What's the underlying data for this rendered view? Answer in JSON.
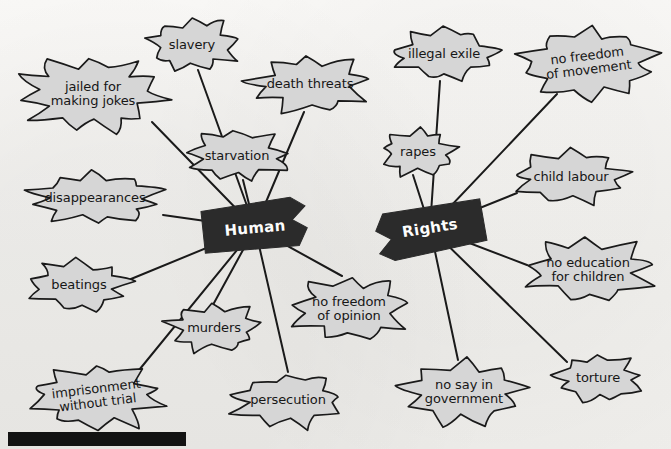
{
  "diagram": {
    "type": "mind-map",
    "title_words": [
      {
        "text": "Human",
        "x": 255,
        "y": 228,
        "rotate": -5
      },
      {
        "text": "Rights",
        "x": 430,
        "y": 228,
        "rotate": -9
      }
    ],
    "background_color": "#f6f5f3",
    "burst_fill": "#d6d6d6",
    "burst_stroke": "#1a1a1a",
    "banner_fill": "#2b2b2b",
    "banner_text_color": "#fdfdfd",
    "edge_color": "#1a1a1a"
  },
  "nodes": [
    {
      "id": "jailed-for-making-jokes",
      "label": "jailed for\nmaking jokes",
      "cx": 93,
      "cy": 94,
      "rx": 74,
      "ry": 38,
      "rotate": 0,
      "font": 13,
      "parent": "human",
      "anchor": [
        152,
        122
      ]
    },
    {
      "id": "slavery",
      "label": "slavery",
      "cx": 192,
      "cy": 45,
      "rx": 48,
      "ry": 28,
      "rotate": 0,
      "font": 13,
      "parent": "human",
      "anchor": [
        198,
        70
      ]
    },
    {
      "id": "death-threats",
      "label": "death threats",
      "cx": 310,
      "cy": 84,
      "rx": 62,
      "ry": 29,
      "rotate": 0,
      "font": 13,
      "parent": "human",
      "anchor": [
        304,
        112
      ]
    },
    {
      "id": "starvation",
      "label": "starvation",
      "cx": 237,
      "cy": 156,
      "rx": 53,
      "ry": 26,
      "rotate": 0,
      "font": 13,
      "parent": "human",
      "anchor": [
        243,
        180
      ]
    },
    {
      "id": "disappearances",
      "label": "disappearances",
      "cx": 95,
      "cy": 198,
      "rx": 70,
      "ry": 27,
      "rotate": 0,
      "font": 13,
      "parent": "human",
      "anchor": [
        163,
        215
      ]
    },
    {
      "id": "beatings",
      "label": "beatings",
      "cx": 79,
      "cy": 285,
      "rx": 53,
      "ry": 26,
      "rotate": 0,
      "font": 13,
      "parent": "human",
      "anchor": [
        131,
        279
      ]
    },
    {
      "id": "imprisonment-without-trial",
      "label": "imprisonment\nwithout trial",
      "cx": 97,
      "cy": 396,
      "rx": 70,
      "ry": 34,
      "rotate": -7,
      "font": 13,
      "parent": "human",
      "anchor": [
        135,
        375
      ]
    },
    {
      "id": "murders",
      "label": "murders",
      "cx": 214,
      "cy": 328,
      "rx": 48,
      "ry": 25,
      "rotate": 0,
      "font": 13,
      "parent": "human",
      "anchor": [
        214,
        303
      ]
    },
    {
      "id": "persecution",
      "label": "persecution",
      "cx": 288,
      "cy": 400,
      "rx": 58,
      "ry": 28,
      "rotate": 0,
      "font": 13,
      "parent": "human",
      "anchor": [
        288,
        372
      ]
    },
    {
      "id": "no-freedom-of-opinion",
      "label": "no freedom\nof opinion",
      "cx": 349,
      "cy": 309,
      "rx": 62,
      "ry": 33,
      "rotate": 0,
      "font": 13,
      "parent": "human",
      "anchor": [
        342,
        276
      ]
    },
    {
      "id": "illegal-exile",
      "label": "illegal exile",
      "cx": 444,
      "cy": 54,
      "rx": 56,
      "ry": 27,
      "rotate": 0,
      "font": 13,
      "parent": "rights",
      "anchor": [
        440,
        81
      ]
    },
    {
      "id": "no-freedom-of-movement",
      "label": "no freedom\nof movement",
      "cx": 588,
      "cy": 63,
      "rx": 72,
      "ry": 36,
      "rotate": -7,
      "font": 13,
      "parent": "rights",
      "anchor": [
        557,
        94
      ]
    },
    {
      "id": "rapes",
      "label": "rapes",
      "cx": 418,
      "cy": 152,
      "rx": 40,
      "ry": 24,
      "rotate": 0,
      "font": 13,
      "parent": "rights",
      "anchor": [
        413,
        175
      ]
    },
    {
      "id": "child-labour",
      "label": "child labour",
      "cx": 571,
      "cy": 177,
      "rx": 60,
      "ry": 28,
      "rotate": 0,
      "font": 13,
      "parent": "rights",
      "anchor": [
        517,
        193
      ]
    },
    {
      "id": "no-education-for-children",
      "label": "no education\nfor children",
      "cx": 588,
      "cy": 270,
      "rx": 66,
      "ry": 33,
      "rotate": 0,
      "font": 13,
      "parent": "rights",
      "anchor": [
        527,
        265
      ]
    },
    {
      "id": "no-say-in-government",
      "label": "no say in\ngovernment",
      "cx": 464,
      "cy": 392,
      "rx": 63,
      "ry": 33,
      "rotate": 0,
      "font": 13,
      "parent": "rights",
      "anchor": [
        458,
        360
      ]
    },
    {
      "id": "torture",
      "label": "torture",
      "cx": 598,
      "cy": 378,
      "rx": 47,
      "ry": 26,
      "rotate": 0,
      "font": 13,
      "parent": "rights",
      "anchor": [
        567,
        362
      ]
    }
  ],
  "hubs": {
    "human": {
      "x": 255,
      "y": 228
    },
    "rights": {
      "x": 430,
      "y": 228
    }
  },
  "black_bar": {
    "x": 8,
    "y": 432,
    "width": 178,
    "height": 14
  }
}
